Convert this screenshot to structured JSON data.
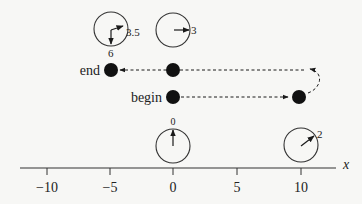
{
  "axis": {
    "label": "x",
    "ticks": [
      {
        "value": -10,
        "label": "−10",
        "px": 47
      },
      {
        "value": -5,
        "label": "−5",
        "px": 110
      },
      {
        "value": 0,
        "label": "0",
        "px": 173
      },
      {
        "value": 5,
        "label": "5",
        "px": 237
      },
      {
        "value": 10,
        "label": "10",
        "px": 301
      }
    ]
  },
  "points": {
    "end": {
      "label": "end",
      "x": -5
    },
    "begin": {
      "label": "begin",
      "x": 0
    },
    "middle_top": {
      "x": 0
    },
    "right": {
      "x": 10
    }
  },
  "dials": [
    {
      "id": "dial-top-left",
      "position_x": -5,
      "value_label": "3.5",
      "extra_label": "6"
    },
    {
      "id": "dial-top-middle",
      "position_x": 0,
      "value_label": "3"
    },
    {
      "id": "dial-bottom-middle",
      "position_x": 0,
      "value_label": "0"
    },
    {
      "id": "dial-bottom-right",
      "position_x": 10,
      "value_label": "2"
    }
  ],
  "colors": {
    "ink": "#1a1a1a",
    "background": "#f7f7f5"
  }
}
